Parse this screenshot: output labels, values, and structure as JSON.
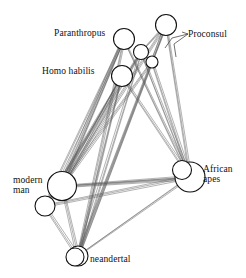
{
  "figure": {
    "type": "network-diagram",
    "title": "",
    "background_color": "#ffffff",
    "node_stroke_color": "#111111",
    "node_fill_color": "#ffffff",
    "edge_color": "#555555",
    "label_color": "#101010",
    "width": 246,
    "height": 278
  },
  "labels": {
    "paranthropus": "Paranthropus",
    "proconsul": "Proconsul",
    "homo_habilis": "Homo habilis",
    "modern_man_line1": "modern",
    "modern_man_line2": "man",
    "african_apes_line1": "African",
    "african_apes_line2": "apes",
    "neandertal": "neandertal"
  },
  "chart_data": {
    "type": "scatter",
    "title": "",
    "xlabel": "",
    "ylabel": "",
    "nodes": [
      {
        "id": "paranthropus",
        "label": "Paranthropus",
        "x": 124,
        "y": 39,
        "r": 10.5
      },
      {
        "id": "unlabeled_a",
        "label": "",
        "x": 141,
        "y": 52,
        "r": 7.5
      },
      {
        "id": "unlabeled_b",
        "label": "",
        "x": 152,
        "y": 62,
        "r": 6.0
      },
      {
        "id": "proconsul",
        "label": "Proconsul",
        "x": 166,
        "y": 25,
        "r": 10.5
      },
      {
        "id": "homo_habilis",
        "label": "Homo habilis",
        "x": 122,
        "y": 76,
        "r": 10.5
      },
      {
        "id": "modern_man",
        "label": "modern man",
        "x": 62,
        "y": 186,
        "r": 14.5
      },
      {
        "id": "modern_man_sub",
        "label": "",
        "x": 45,
        "y": 206,
        "r": 10.0
      },
      {
        "id": "african_apes",
        "label": "African apes",
        "x": 190,
        "y": 177,
        "r": 15.0
      },
      {
        "id": "african_apes_b",
        "label": "",
        "x": 182,
        "y": 170,
        "r": 9.5
      },
      {
        "id": "neandertal",
        "label": "neandertal",
        "x": 78,
        "y": 256,
        "r": 10.0
      },
      {
        "id": "neandertal_b",
        "label": "",
        "x": 75,
        "y": 257,
        "r": 9.0
      }
    ],
    "edges": [
      [
        "paranthropus",
        "modern_man"
      ],
      [
        "paranthropus",
        "modern_man"
      ],
      [
        "paranthropus",
        "modern_man_sub"
      ],
      [
        "paranthropus",
        "neandertal"
      ],
      [
        "paranthropus",
        "african_apes"
      ],
      [
        "unlabeled_a",
        "modern_man"
      ],
      [
        "unlabeled_a",
        "modern_man_sub"
      ],
      [
        "unlabeled_a",
        "neandertal"
      ],
      [
        "unlabeled_a",
        "african_apes"
      ],
      [
        "unlabeled_a",
        "proconsul"
      ],
      [
        "unlabeled_b",
        "modern_man"
      ],
      [
        "unlabeled_b",
        "neandertal"
      ],
      [
        "unlabeled_b",
        "african_apes"
      ],
      [
        "unlabeled_b",
        "proconsul"
      ],
      [
        "proconsul",
        "modern_man"
      ],
      [
        "proconsul",
        "african_apes"
      ],
      [
        "proconsul",
        "neandertal"
      ],
      [
        "homo_habilis",
        "modern_man"
      ],
      [
        "homo_habilis",
        "modern_man_sub"
      ],
      [
        "homo_habilis",
        "neandertal"
      ],
      [
        "homo_habilis",
        "african_apes"
      ],
      [
        "modern_man",
        "african_apes"
      ],
      [
        "modern_man",
        "african_apes"
      ],
      [
        "modern_man",
        "neandertal"
      ],
      [
        "modern_man",
        "modern_man_sub"
      ],
      [
        "modern_man_sub",
        "neandertal"
      ],
      [
        "modern_man_sub",
        "african_apes"
      ],
      [
        "neandertal",
        "african_apes"
      ]
    ],
    "legend": [],
    "grid": false
  },
  "label_positions": {
    "paranthropus": {
      "x": 54,
      "y": 29,
      "align": "left"
    },
    "proconsul": {
      "x": 188,
      "y": 30,
      "align": "left"
    },
    "homo_habilis": {
      "x": 42,
      "y": 67,
      "align": "left"
    },
    "modern_man": {
      "x": 13,
      "y": 176,
      "align": "left"
    },
    "african_apes": {
      "x": 203,
      "y": 165,
      "align": "left"
    },
    "neandertal": {
      "x": 90,
      "y": 255,
      "align": "left"
    }
  }
}
